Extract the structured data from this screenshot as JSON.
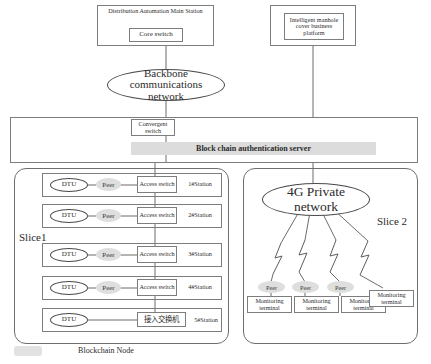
{
  "diagram": {
    "title_top_left": "Distribution Automation Main Station",
    "core_switch": "Core switch",
    "platform": "Intelligent manhole cover business platform",
    "backbone_cloud": "Backbone communications network",
    "convergent_switch": "Convergent switch",
    "blockchain_server": "Block chain authentication server",
    "slice1_label": "Slice1",
    "slice2_label": "Slice 2",
    "blockchain_node_label": "Blockchain Node",
    "private_network": "4G Private network",
    "dtu_label": "DTU",
    "peer_label": "Peer",
    "access_switch_label": "Access switch",
    "access_switch_cjk": "接入交换机",
    "monitoring_terminal": "Monitoring terminal",
    "stations": [
      {
        "name": "1#Station",
        "dtu": "DTU",
        "peer": "Peer",
        "switch": "Access switch",
        "switch_cjk": false
      },
      {
        "name": "2#Station",
        "dtu": "DTU",
        "peer": "Peer",
        "switch": "Access switch",
        "switch_cjk": false
      },
      {
        "name": "3#Station",
        "dtu": "DTU",
        "peer": "Peer",
        "switch": "Access switch",
        "switch_cjk": false
      },
      {
        "name": "4#Station",
        "dtu": "DTU",
        "peer": "Peer",
        "switch": "Access switch",
        "switch_cjk": false
      },
      {
        "name": "5#Station",
        "dtu": "DTU",
        "peer": "",
        "switch": "接入交换机",
        "switch_cjk": true
      }
    ],
    "terminals": [
      {
        "peer": "Peer",
        "label": "Monitoring terminal"
      },
      {
        "peer": "Peer",
        "label": "Monitoring terminal"
      },
      {
        "peer": "Peer",
        "label": "Monitoring terminal"
      },
      {
        "peer": "",
        "label": "Monitoring terminal"
      }
    ],
    "colors": {
      "line": "#6b6b6b",
      "peer_fill": "#dedede",
      "band_fill": "#dcdcdc",
      "text": "#2b2b2b"
    }
  }
}
